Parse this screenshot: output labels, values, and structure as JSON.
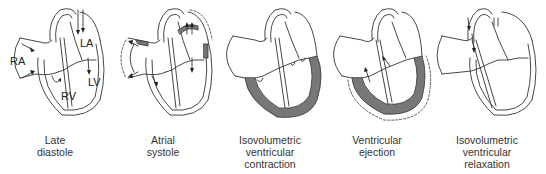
{
  "figure": {
    "accent_fill": "#777777",
    "panels": [
      {
        "id": "late-diastole",
        "caption": [
          "Late",
          "diastole"
        ],
        "chamber_labels": {
          "ra": "RA",
          "la": "LA",
          "rv": "RV",
          "lv": "LV"
        },
        "shaded_regions": [],
        "flow_arrows": "blood entering atria and passing through open AV valves into ventricles"
      },
      {
        "id": "atrial-systole",
        "caption": [
          "Atrial",
          "systole"
        ],
        "shaded_regions": [
          "atrial walls"
        ],
        "flow_arrows": "atria contracting, blood pushed into ventricles"
      },
      {
        "id": "isovolumetric-ventricular-contraction",
        "caption": [
          "Isovolumetric",
          "ventricular",
          "contraction"
        ],
        "shaded_regions": [
          "ventricular walls"
        ],
        "flow_arrows": "none; AV valves closed"
      },
      {
        "id": "ventricular-ejection",
        "caption": [
          "Ventricular",
          "ejection"
        ],
        "shaded_regions": [
          "ventricular walls"
        ],
        "flow_arrows": "blood ejected upward into aorta and pulmonary artery"
      },
      {
        "id": "isovolumetric-ventricular-relaxation",
        "caption": [
          "Isovolumetric",
          "ventricular",
          "relaxation"
        ],
        "shaded_regions": [],
        "flow_arrows": "backflow closing semilunar valves"
      }
    ]
  }
}
